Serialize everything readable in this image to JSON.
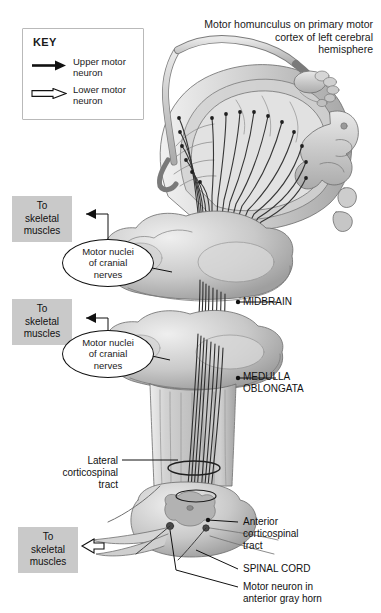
{
  "figure": {
    "title_lines": [
      "Motor homunculus on primary motor",
      "cortex of left cerebral",
      "hemisphere"
    ]
  },
  "key": {
    "heading": "KEY",
    "items": [
      {
        "icon": "solid-arrow-icon",
        "label_line1": "Upper motor",
        "label_line2": "neuron"
      },
      {
        "icon": "hollow-arrow-icon",
        "label_line1": "Lower motor",
        "label_line2": "neuron"
      }
    ]
  },
  "callout_boxes": [
    {
      "line1": "To",
      "line2": "skeletal",
      "line3": "muscles",
      "arrow": "solid"
    },
    {
      "line1": "To",
      "line2": "skeletal",
      "line3": "muscles",
      "arrow": "solid"
    },
    {
      "line1": "To",
      "line2": "skeletal",
      "line3": "muscles",
      "arrow": "hollow"
    }
  ],
  "balloons": [
    {
      "line1": "Motor nuclei",
      "line2": "of cranial",
      "line3": "nerves"
    },
    {
      "line1": "Motor nuclei",
      "line2": "of cranial",
      "line3": "nerves"
    }
  ],
  "labels": {
    "midbrain": "MIDBRAIN",
    "medulla_line1": "MEDULLA",
    "medulla_line2": "OBLONGATA",
    "lateral_line1": "Lateral",
    "lateral_line2": "corticospinal",
    "lateral_line3": "tract",
    "anterior_line1": "Anterior",
    "anterior_line2": "corticospinal",
    "anterior_line3": "tract",
    "spinal_cord": "SPINAL CORD",
    "motor_neuron_line1": "Motor neuron in",
    "motor_neuron_line2": "anterior gray horn"
  },
  "colors": {
    "gray_box": "#c9c9c9",
    "tissue_light": "#e2e2e2",
    "tissue_mid": "#c6c6c6",
    "tissue_dark": "#a9a9a9",
    "outline": "#6b6b6b",
    "fiber": "#333333",
    "text": "#1a1a1a"
  }
}
